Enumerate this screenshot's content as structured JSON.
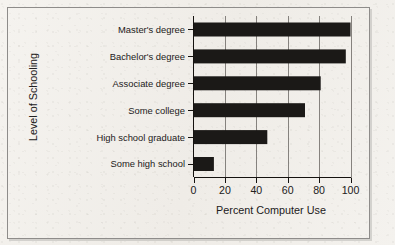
{
  "figure": {
    "frame_color": "#8e8c8a",
    "background_color": "#f3f1ed",
    "bar_color": "#1b1917",
    "axis_color": "#15120f",
    "gridline_color": "#6a6663"
  },
  "chart_data": {
    "type": "bar",
    "orientation": "horizontal",
    "title": "",
    "xlabel": "Percent Computer Use",
    "ylabel": "Level of Schooling",
    "categories": [
      "Master's degree",
      "Bachelor's degree",
      "Associate degree",
      "Some college",
      "High school graduate",
      "Some high school"
    ],
    "values": [
      100,
      97,
      81,
      71,
      47,
      13
    ],
    "xlim": [
      0,
      100
    ],
    "xticks": [
      0,
      20,
      40,
      60,
      80,
      100
    ],
    "xtick_labels": [
      "0",
      "20",
      "40",
      "60",
      "80",
      "100"
    ],
    "grid": "vertical",
    "legend": "none",
    "series": [
      {
        "name": "Percent Computer Use",
        "values": [
          100,
          97,
          81,
          71,
          47,
          13
        ]
      }
    ]
  }
}
